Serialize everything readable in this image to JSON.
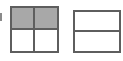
{
  "figure": {
    "background_color": "#ffffff",
    "line_color": "#5e5e5e",
    "shade_color": "#a8a8a8",
    "unshaded_color": "#ffffff"
  },
  "artifact": {
    "name": "left-edge-scan-mark",
    "color": "#8a8a8a"
  },
  "models": [
    {
      "id": "left-model",
      "name": "two-by-two-square-model",
      "shape": "square",
      "rows": 2,
      "columns": 2,
      "total_parts": 4,
      "shaded_parts": 2,
      "fraction": "2/4",
      "cells": [
        {
          "row": 1,
          "column": 1,
          "shaded": true
        },
        {
          "row": 1,
          "column": 2,
          "shaded": true
        },
        {
          "row": 2,
          "column": 1,
          "shaded": false
        },
        {
          "row": 2,
          "column": 2,
          "shaded": false
        }
      ]
    },
    {
      "id": "right-model",
      "name": "one-by-two-rectangle-model",
      "shape": "rectangle",
      "rows": 2,
      "columns": 1,
      "total_parts": 2,
      "shaded_parts": 0,
      "fraction": "0/2",
      "cells": [
        {
          "row": 1,
          "column": 1,
          "shaded": false
        },
        {
          "row": 2,
          "column": 1,
          "shaded": false
        }
      ]
    }
  ]
}
